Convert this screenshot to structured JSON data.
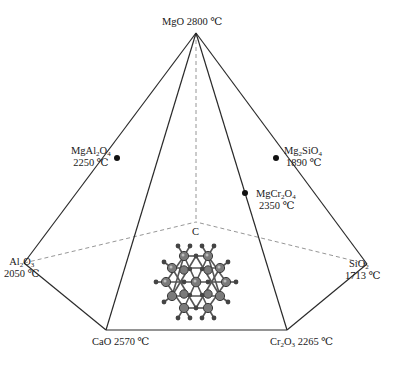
{
  "diagram": {
    "apex": {
      "formula": "MgO",
      "temperature": "2800 ℃"
    },
    "base_vertices": [
      {
        "formula_html": "Al<sub>2</sub>O<sub>3</sub>",
        "formula": "Al2O3",
        "temperature": "2050 ℃"
      },
      {
        "formula_html": "CaO",
        "formula": "CaO",
        "temperature": "2570 ℃"
      },
      {
        "formula_html": "Cr<sub>2</sub>O<sub>3</sub>",
        "formula": "Cr2O3",
        "temperature": "2265 ℃"
      },
      {
        "formula_html": "SiO<sub>2</sub>",
        "formula": "SiO2",
        "temperature": "1713 ℃"
      }
    ],
    "edge_compounds": [
      {
        "formula_html": "MgAl<sub>2</sub>O<sub>4</sub>",
        "formula": "MgAl2O4",
        "temperature": "2250 ℃"
      },
      {
        "formula_html": "Mg<sub>2</sub>SiO<sub>4</sub>",
        "formula": "Mg2SiO4",
        "temperature": "1890 ℃"
      },
      {
        "formula_html": "MgCr<sub>2</sub>O<sub>4</sub>",
        "formula": "MgCr2O4",
        "temperature": "2350 ℃"
      }
    ],
    "center_label": "C",
    "colors": {
      "line": "#2a2a2a",
      "dashed": "#8a8a8a",
      "atom_large": "#7a7a7a",
      "atom_small": "#4a4a4a",
      "bond": "#555555"
    }
  }
}
